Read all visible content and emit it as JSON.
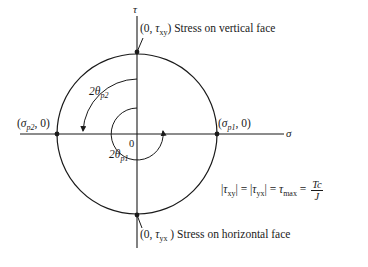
{
  "diagram": {
    "axes": {
      "vertical_label": "τ",
      "horizontal_label": "σ",
      "origin_label": "0"
    },
    "points": {
      "top": {
        "coord_prefix": "(0, ",
        "symbol": "τ",
        "subscript": "xy",
        "coord_suffix": ")",
        "description": "Stress on vertical face"
      },
      "bottom": {
        "coord_prefix": "(0, ",
        "symbol": "τ",
        "subscript": "yx",
        "coord_suffix": " )",
        "description": "Stress on horizontal face"
      },
      "left": {
        "coord_prefix": "(",
        "symbol": "σ",
        "subscript": "p2",
        "coord_suffix": ", 0)"
      },
      "right": {
        "coord_prefix": "(",
        "symbol": "σ",
        "subscript": "p1",
        "coord_suffix": ", 0)"
      }
    },
    "angles": {
      "outer": {
        "prefix": "2",
        "symbol": "θ",
        "subscript": "p2"
      },
      "inner": {
        "prefix": "2",
        "symbol": "θ",
        "subscript": "p1"
      }
    },
    "equation": {
      "lhs_bar1_symbol": "τ",
      "lhs_bar1_sub": "xy",
      "eq1": " = ",
      "lhs_bar2_symbol": "τ",
      "lhs_bar2_sub": "yx",
      "eq2": " = ",
      "max_symbol": "τ",
      "max_sub": "max",
      "eq3": " = ",
      "numerator": "Tc",
      "denominator": "J"
    },
    "colors": {
      "ink": "#1a1a1a",
      "background": "#ffffff"
    }
  }
}
